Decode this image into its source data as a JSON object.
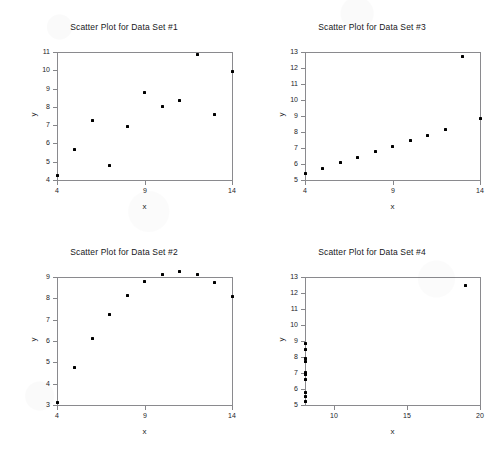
{
  "figure": {
    "background_color": "#ffffff",
    "marker_color": "#000000",
    "axis_color": "#86868a",
    "layout": "2x2 grid of scatter plots"
  },
  "chart_data": [
    {
      "type": "scatter",
      "title": "Scatter Plot for Data Set #1",
      "xlabel": "x",
      "ylabel": "y",
      "xlim": [
        4,
        14
      ],
      "ylim": [
        4,
        11
      ],
      "xticks": [
        4,
        9,
        14
      ],
      "yticks": [
        4,
        5,
        6,
        7,
        8,
        9,
        10,
        11
      ],
      "grid": false,
      "legend": "none",
      "x": [
        10.0,
        8.0,
        13.0,
        9.0,
        11.0,
        14.0,
        6.0,
        4.0,
        12.0,
        7.0,
        5.0
      ],
      "y": [
        8.04,
        6.95,
        7.58,
        8.81,
        8.33,
        9.96,
        7.24,
        4.26,
        10.84,
        4.82,
        5.68
      ]
    },
    {
      "type": "scatter",
      "title": "Scatter Plot for Data Set #3",
      "xlabel": "x",
      "ylabel": "y",
      "xlim": [
        4,
        14
      ],
      "ylim": [
        5,
        13
      ],
      "xticks": [
        4,
        9,
        14
      ],
      "yticks": [
        5,
        6,
        7,
        8,
        9,
        10,
        11,
        12,
        13
      ],
      "grid": false,
      "legend": "none",
      "x": [
        10.0,
        8.0,
        13.0,
        9.0,
        11.0,
        14.0,
        6.0,
        4.0,
        12.0,
        7.0,
        5.0
      ],
      "y": [
        7.46,
        6.77,
        12.74,
        7.11,
        7.81,
        8.84,
        6.08,
        5.39,
        8.15,
        6.42,
        5.73
      ]
    },
    {
      "type": "scatter",
      "title": "Scatter Plot for Data Set #2",
      "xlabel": "x",
      "ylabel": "y",
      "xlim": [
        4,
        14
      ],
      "ylim": [
        3,
        9
      ],
      "xticks": [
        4,
        9,
        14
      ],
      "yticks": [
        3,
        4,
        5,
        6,
        7,
        8,
        9
      ],
      "grid": false,
      "legend": "none",
      "x": [
        10.0,
        8.0,
        13.0,
        9.0,
        11.0,
        14.0,
        6.0,
        4.0,
        12.0,
        7.0,
        5.0
      ],
      "y": [
        9.14,
        8.14,
        8.74,
        8.77,
        9.26,
        8.1,
        6.13,
        3.1,
        9.13,
        7.26,
        4.74
      ]
    },
    {
      "type": "scatter",
      "title": "Scatter Plot for Data Set #4",
      "xlabel": "x",
      "ylabel": "y",
      "xlim": [
        8,
        20
      ],
      "ylim": [
        5,
        13
      ],
      "xticks": [
        10,
        15,
        20
      ],
      "yticks": [
        5,
        6,
        7,
        8,
        9,
        10,
        11,
        12,
        13
      ],
      "grid": false,
      "legend": "none",
      "x": [
        8.0,
        8.0,
        8.0,
        8.0,
        8.0,
        8.0,
        8.0,
        19.0,
        8.0,
        8.0,
        8.0
      ],
      "y": [
        6.58,
        5.76,
        7.71,
        8.84,
        8.47,
        7.04,
        5.25,
        12.5,
        5.56,
        7.91,
        6.89
      ]
    }
  ]
}
